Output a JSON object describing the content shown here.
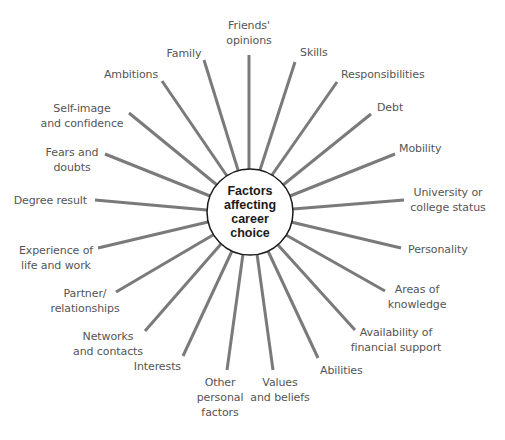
{
  "diagram": {
    "title": "Factors\naffecting\ncareer\nchoice",
    "colors": {
      "spoke": "#7a7a7a",
      "hub_border": "#1a1a1a",
      "label": "#555555",
      "title": "#1a1a1a"
    },
    "hub": {
      "cx": 250,
      "cy": 212,
      "r": 43
    },
    "factors": [
      {
        "label": "Friends'\nopinions",
        "end": [
          249,
          55
        ]
      },
      {
        "label": "Skills",
        "end": [
          295,
          62
        ]
      },
      {
        "label": "Responsibilities",
        "end": [
          337,
          82
        ]
      },
      {
        "label": "Debt",
        "end": [
          371,
          114
        ]
      },
      {
        "label": "Mobility",
        "end": [
          395,
          154
        ]
      },
      {
        "label": "University or\ncollege status",
        "end": [
          404,
          200
        ]
      },
      {
        "label": "Personality",
        "end": [
          401,
          248
        ]
      },
      {
        "label": "Areas of\nknowledge",
        "end": [
          385,
          291
        ]
      },
      {
        "label": "Availability of\nfinancial support",
        "end": [
          355,
          330
        ]
      },
      {
        "label": "Abilities",
        "end": [
          318,
          358
        ]
      },
      {
        "label": "Values\nand beliefs",
        "end": [
          273,
          370
        ]
      },
      {
        "label": "Other\npersonal\nfactors",
        "end": [
          227,
          370
        ]
      },
      {
        "label": "Interests",
        "end": [
          183,
          356
        ]
      },
      {
        "label": "Networks\nand contacts",
        "end": [
          145,
          331
        ]
      },
      {
        "label": "Partner/\nrelationships",
        "end": [
          116,
          292
        ]
      },
      {
        "label": "Experience of\nlife and work",
        "end": [
          98,
          248
        ]
      },
      {
        "label": "Degree result",
        "end": [
          95,
          200
        ]
      },
      {
        "label": "Fears and\ndoubts",
        "end": [
          105,
          154
        ]
      },
      {
        "label": "Self-image\nand confidence",
        "end": [
          129,
          113
        ]
      },
      {
        "label": "Ambitions",
        "end": [
          162,
          81
        ]
      },
      {
        "label": "Family",
        "end": [
          204,
          60
        ]
      }
    ]
  }
}
